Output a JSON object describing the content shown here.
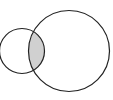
{
  "diagram": {
    "type": "venn",
    "sets": [
      {
        "id": "A",
        "position": "left",
        "size": "small",
        "cx": 22,
        "cy": 51,
        "r": 22.5
      },
      {
        "id": "B",
        "position": "right",
        "size": "large",
        "cx": 69,
        "cy": 51,
        "r": 40.5
      }
    ],
    "highlighted_region": "A-intersect-B",
    "colors": {
      "background": "#ffffff",
      "stroke": "#222222",
      "intersection_fill": "#d0d0d0"
    },
    "stroke_width": 1.2
  }
}
